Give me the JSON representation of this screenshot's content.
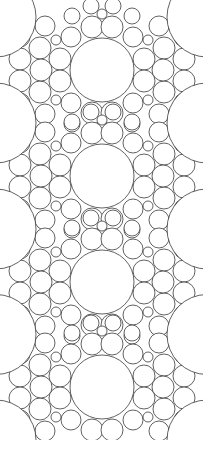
{
  "diagram": {
    "type": "circle-packing",
    "stroke_color": "#3a3a3a",
    "fill_color": "#ffffff",
    "stroke_width": 0.8,
    "axis_x": 102,
    "big_circle": {
      "r": 32
    },
    "tile_centers_y": [
      70,
      176,
      282,
      387
    ],
    "tile_quadrant_circles": [
      {
        "dx": -10,
        "dy": -43,
        "r": 11
      },
      {
        "dx": -31,
        "dy": -33,
        "r": 10
      },
      {
        "dx": -42,
        "dy": -11,
        "r": 11
      },
      {
        "dx": -46,
        "dy": -30,
        "r": 5
      },
      {
        "dx": -62,
        "dy": -22,
        "r": 11
      },
      {
        "dx": -61,
        "dy": 0,
        "r": 11
      },
      {
        "dx": -82,
        "dy": -11,
        "r": 11
      },
      {
        "dx": -57,
        "dy": -44,
        "r": 10
      },
      {
        "dx": -30,
        "dy": -54,
        "r": 8
      },
      {
        "dx": 0,
        "dy": -56,
        "r": 5
      },
      {
        "dx": -11,
        "dy": -64,
        "r": 8
      },
      {
        "dx": -82,
        "dy": -33,
        "r": 10
      }
    ],
    "edge_arcs": {
      "cx_offset": -4,
      "r": 40
    },
    "height": 440
  },
  "caption": {
    "text": ""
  }
}
